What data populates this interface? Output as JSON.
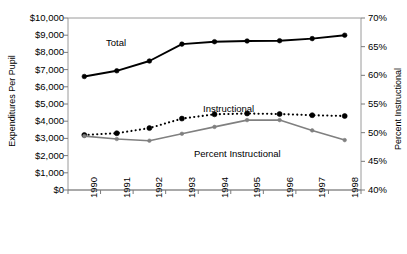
{
  "chart_data": {
    "type": "line",
    "title": "",
    "xlabel": "",
    "ylabel": "Expenditures Per Pupil",
    "y2label": "Percent Instructional",
    "categories": [
      "1990",
      "1991",
      "1992",
      "1993",
      "1994",
      "1995",
      "1996",
      "1997",
      "1998"
    ],
    "ylim": [
      0,
      10000
    ],
    "yticks": [
      "$0",
      "$1,000",
      "$2,000",
      "$3,000",
      "$4,000",
      "$5,000",
      "$6,000",
      "$7,000",
      "$8,000",
      "$9,000",
      "$10,000"
    ],
    "ytick_values": [
      0,
      1000,
      2000,
      3000,
      4000,
      5000,
      6000,
      7000,
      8000,
      9000,
      10000
    ],
    "y2lim": [
      40,
      70
    ],
    "y2ticks": [
      "40%",
      "45%",
      "50%",
      "55%",
      "60%",
      "65%",
      "70%"
    ],
    "y2tick_values": [
      40,
      45,
      50,
      55,
      60,
      65,
      70
    ],
    "grid": false,
    "legend": "inline-annotations",
    "series": [
      {
        "name": "Total",
        "axis": "left",
        "style": "solid",
        "color": "#000000",
        "marker": "circle",
        "values": [
          6600,
          6930,
          7500,
          8480,
          8620,
          8660,
          8680,
          8800,
          9000
        ]
      },
      {
        "name": "Instructional",
        "axis": "left",
        "style": "dotted",
        "color": "#000000",
        "marker": "circle",
        "values": [
          3200,
          3300,
          3600,
          4150,
          4400,
          4450,
          4420,
          4350,
          4300
        ]
      },
      {
        "name": "Percent Instructional",
        "axis": "right",
        "style": "solid",
        "color": "#808080",
        "marker": "circle",
        "values": [
          49.4,
          48.9,
          48.6,
          49.8,
          51.0,
          52.2,
          52.2,
          50.4,
          48.7
        ]
      }
    ],
    "annotations": [
      {
        "text": "Total",
        "x": 1992.3,
        "series": "Total"
      },
      {
        "text": "Instructional",
        "x": 1995.0,
        "series": "Instructional"
      },
      {
        "text": "Percent Instructional",
        "x": 1995.2,
        "series": "Percent Instructional"
      }
    ]
  }
}
